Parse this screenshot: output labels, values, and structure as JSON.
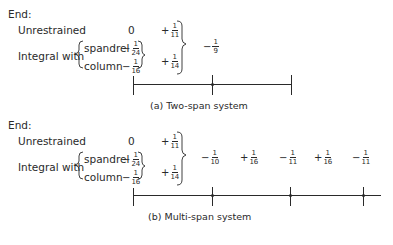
{
  "panel_a": {
    "end_label": "End:",
    "unrestrained_label": "Unrestrained",
    "integral_label": "Integral with",
    "spandrel_label": "spandrel",
    "column_label": "column",
    "unrestrained_end_value": "0",
    "spandrel_value": {
      "sign": "−",
      "num": "1",
      "den": "24"
    },
    "column_value": {
      "sign": "−",
      "num": "1",
      "den": "16"
    },
    "span_unrestrained": {
      "sign": "+",
      "num": "1",
      "den": "11"
    },
    "span_integral": {
      "sign": "+",
      "num": "1",
      "den": "14"
    },
    "support_moment": {
      "sign": "−",
      "num": "1",
      "den": "9"
    },
    "caption": "(a)  Two-span system"
  },
  "panel_b": {
    "end_label": "End:",
    "unrestrained_label": "Unrestrained",
    "integral_label": "Integral with",
    "spandrel_label": "spandrel",
    "column_label": "column",
    "unrestrained_end_value": "0",
    "spandrel_value": {
      "sign": "−",
      "num": "1",
      "den": "24"
    },
    "column_value": {
      "sign": "−",
      "num": "1",
      "den": "16"
    },
    "span_unrestrained": {
      "sign": "+",
      "num": "1",
      "den": "11"
    },
    "span_integral": {
      "sign": "+",
      "num": "1",
      "den": "14"
    },
    "moments": [
      {
        "sign": "−",
        "num": "1",
        "den": "10"
      },
      {
        "sign": "+",
        "num": "1",
        "den": "16"
      },
      {
        "sign": "−",
        "num": "1",
        "den": "11"
      },
      {
        "sign": "+",
        "num": "1",
        "den": "16"
      },
      {
        "sign": "−",
        "num": "1",
        "den": "11"
      }
    ],
    "caption": "(b)  Multi-span system"
  }
}
